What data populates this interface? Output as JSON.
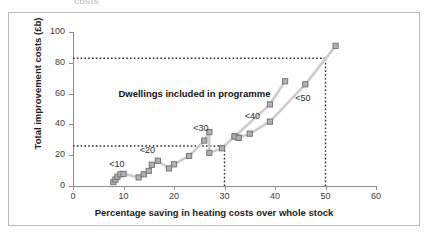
{
  "figure": {
    "clipped_caption": "costs",
    "region_note": "Dwellings included in programme"
  },
  "chart_data": {
    "type": "scatter",
    "title": "",
    "xlabel": "Percentage saving in heating costs over whole stock",
    "ylabel": "Total improvement costs (£b)",
    "xlim": [
      0,
      60
    ],
    "ylim": [
      0,
      100
    ],
    "xticks": [
      0,
      10,
      20,
      30,
      40,
      50,
      60
    ],
    "yticks": [
      0,
      20,
      40,
      60,
      80,
      100
    ],
    "xtick_labels": [
      "0",
      "10",
      "20",
      "30",
      "40",
      "50",
      "60"
    ],
    "ytick_labels": [
      "0",
      "20",
      "40",
      "60",
      "80",
      "100"
    ],
    "grid": false,
    "legend": "none",
    "marker": "square",
    "marker_color": "#b0b0b0",
    "marker_edge_color": "#6e6e6e",
    "line_color": "#cccccc",
    "series": [
      {
        "name": "Main curve",
        "points": [
          [
            8.0,
            2.5
          ],
          [
            8.4,
            4.2
          ],
          [
            8.8,
            6.0
          ],
          [
            9.4,
            7.6
          ],
          [
            10.0,
            7.9
          ],
          [
            13.0,
            5.6
          ],
          [
            14.0,
            7.6
          ],
          [
            15.0,
            9.8
          ],
          [
            15.6,
            13.8
          ],
          [
            16.8,
            16.4
          ],
          [
            19.0,
            11.4
          ],
          [
            20.0,
            14.1
          ],
          [
            23.0,
            19.5
          ],
          [
            26.0,
            29.5
          ],
          [
            27.0,
            35.0
          ],
          [
            27.0,
            21.5
          ],
          [
            29.5,
            24.5
          ],
          [
            32.0,
            32.2
          ],
          [
            32.8,
            31.3
          ]
        ]
      },
      {
        "name": "Upper branch (<40)",
        "points": [
          [
            32.0,
            32.2
          ],
          [
            39.0,
            53.0
          ],
          [
            42.0,
            68.0
          ]
        ]
      },
      {
        "name": "Lower branch (<50)",
        "points": [
          [
            32.8,
            31.3
          ],
          [
            35.0,
            34.0
          ],
          [
            39.0,
            41.8
          ],
          [
            46.0,
            66.0
          ],
          [
            52.0,
            91.0
          ]
        ]
      }
    ],
    "reference_lines": [
      {
        "name": "upper-horizontal",
        "orientation": "horizontal",
        "value": 83,
        "style": "dotted",
        "from_x": 0,
        "to_x": 50
      },
      {
        "name": "lower-horizontal",
        "orientation": "horizontal",
        "value": 26,
        "style": "dotted",
        "from_x": 0,
        "to_x": 30
      },
      {
        "name": "x30-vertical",
        "orientation": "vertical",
        "value": 30,
        "style": "dotted",
        "from_y": 0,
        "to_y": 26
      },
      {
        "name": "x50-vertical",
        "orientation": "vertical",
        "value": 50,
        "style": "dotted",
        "from_y": 0,
        "to_y": 83
      }
    ],
    "annotations": [
      {
        "label": "<10",
        "x": 7.2,
        "y": 13.5
      },
      {
        "label": "<20",
        "x": 13.2,
        "y": 23.0
      },
      {
        "label": "<30",
        "x": 23.8,
        "y": 37.0
      },
      {
        "label": "<40",
        "x": 34.0,
        "y": 44.5
      },
      {
        "label": "<50",
        "x": 44.0,
        "y": 56.5
      },
      {
        "label": "Dwellings included in programme",
        "x": 9.0,
        "y": 60.0
      }
    ]
  }
}
